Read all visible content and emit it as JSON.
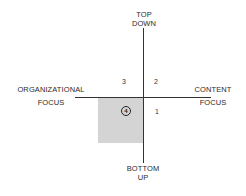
{
  "diagram": {
    "axes": {
      "top": {
        "line1": "TOP",
        "line2": "DOWN"
      },
      "bottom": {
        "line1": "BOTTOM",
        "line2": "UP"
      },
      "left": {
        "line1": "ORGANIZATIONAL",
        "line2": "FOCUS"
      },
      "right": {
        "line1": "CONTENT",
        "line2": "FOCUS"
      }
    },
    "quadrants": [
      {
        "id": "1",
        "label": "1"
      },
      {
        "id": "2",
        "label": "2"
      },
      {
        "id": "3",
        "label": "3"
      },
      {
        "id": "4",
        "label": "4",
        "circled": true,
        "highlighted": true
      }
    ],
    "colors": {
      "highlight": "#d4d4d4",
      "line": "#333333"
    }
  }
}
